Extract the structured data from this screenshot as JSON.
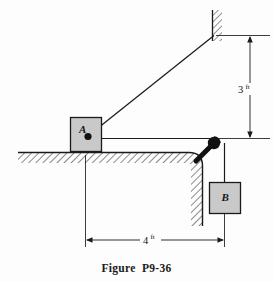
{
  "figure": {
    "caption": "Figure  P9-36",
    "background_color": "#fdfdfd",
    "line_color": "#1a1a1a",
    "block_fill_color": "#c9c9c9",
    "block_edge_color": "#1a1a1a"
  },
  "bodies": {
    "block_a": {
      "label": "A",
      "description": "block-a-on-ledge"
    },
    "block_b": {
      "label": "B",
      "description": "hanging-block-b"
    }
  },
  "dimensions": {
    "vertical": {
      "value": "3",
      "unit": "ft",
      "full": "3 ft"
    },
    "horizontal": {
      "value": "4",
      "unit": "ft",
      "full": "4 ft"
    }
  },
  "elements": {
    "wall": "hatched-vertical-wall",
    "ground": "hatched-horizontal-ledge",
    "pulley": "pulley-at-ledge-corner",
    "cable_diagonal": "cable-from-a-to-wall",
    "cable_horizontal": "cord-from-a-to-pulley",
    "cable_vertical": "cord-from-pulley-to-b",
    "pin_a": "pin-connection-at-block-a",
    "strut": "pulley-support-strut"
  }
}
